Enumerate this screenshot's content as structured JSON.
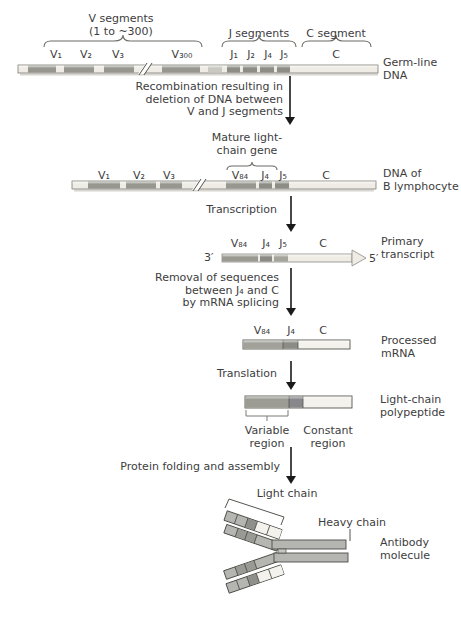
{
  "palette": {
    "segment_gray": "#9b9b94",
    "segment_dark": "#8a8a84",
    "segment_light": "#eeece4",
    "segment_white": "#f3f2ec",
    "bar_outline": "#6a6a66",
    "heavy_chain_gray": "#b5b5b1",
    "outline_dark": "#4c4c48",
    "text": "#3d3d3d",
    "arrow": "#1a1a1a",
    "background": "#ffffff"
  },
  "header": {
    "v_group": {
      "line1": "V segments",
      "line2": "(1 to ~300)"
    },
    "j_group": "J segments",
    "c_group": "C segment"
  },
  "germline": {
    "segments": [
      "V₁",
      "V₂",
      "V₃",
      "V₃₀₀",
      "J₁",
      "J₂",
      "J₄",
      "J₅",
      "C"
    ],
    "label": {
      "line1": "Germ-line",
      "line2": "DNA"
    }
  },
  "step_recombination": {
    "line1": "Recombination resulting in",
    "line2": "deletion of DNA between",
    "line3": "V and J segments"
  },
  "mature_gene": {
    "line1": "Mature light-",
    "line2": "chain gene"
  },
  "b_lymphocyte": {
    "segments": [
      "V₁",
      "V₂",
      "V₃",
      "V₈₄",
      "J₄",
      "J₅",
      "C"
    ],
    "label": {
      "line1": "DNA of",
      "line2": "B lymphocyte"
    }
  },
  "step_transcription": "Transcription",
  "primary_transcript": {
    "three_prime": "3′",
    "five_prime": "5′",
    "segments": [
      "V₈₄",
      "J₄",
      "J₅",
      "C"
    ],
    "label": {
      "line1": "Primary",
      "line2": "transcript"
    }
  },
  "step_splicing": {
    "line1": "Removal of sequences",
    "line2": "between J₄ and C",
    "line3": "by mRNA splicing"
  },
  "processed_mrna": {
    "segments": [
      "V₈₄",
      "J₄",
      "C"
    ],
    "label": {
      "line1": "Processed",
      "line2": "mRNA"
    }
  },
  "step_translation": "Translation",
  "polypeptide": {
    "variable_region": {
      "line1": "Variable",
      "line2": "region"
    },
    "constant_region": {
      "line1": "Constant",
      "line2": "region"
    },
    "label": {
      "line1": "Light-chain",
      "line2": "polypeptide"
    }
  },
  "step_folding": "Protein folding and assembly",
  "antibody": {
    "light_chain": "Light chain",
    "heavy_chain": "Heavy chain",
    "label": {
      "line1": "Antibody",
      "line2": "molecule"
    }
  }
}
